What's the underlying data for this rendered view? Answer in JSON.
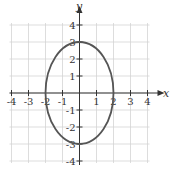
{
  "chart_data": {
    "type": "line",
    "title": "",
    "xlabel": "x",
    "ylabel": "y",
    "xlim": [
      -4,
      4
    ],
    "ylim": [
      -4,
      4
    ],
    "grid": true,
    "x_ticks": [
      -4,
      -3,
      -2,
      -1,
      1,
      2,
      3,
      4
    ],
    "y_ticks": [
      -4,
      -3,
      -2,
      -1,
      1,
      2,
      3,
      4
    ],
    "x_tick_labels": [
      "-4",
      "-3",
      "-2",
      "-1",
      "1",
      "2",
      "3",
      "4"
    ],
    "y_tick_labels": [
      "-4",
      "-3",
      "-2",
      "-1",
      "1",
      "2",
      "3",
      "4"
    ],
    "series": [
      {
        "name": "ellipse",
        "shape": "ellipse",
        "center": [
          0,
          0
        ],
        "semi_axis_x": 2,
        "semi_axis_y": 3,
        "key_points": [
          [
            2,
            0
          ],
          [
            0,
            3
          ],
          [
            -2,
            0
          ],
          [
            0,
            -3
          ]
        ],
        "color": "#555555"
      }
    ]
  },
  "colors": {
    "grid": "#d4d4d4",
    "axis": "#333333",
    "curve": "#555555"
  }
}
